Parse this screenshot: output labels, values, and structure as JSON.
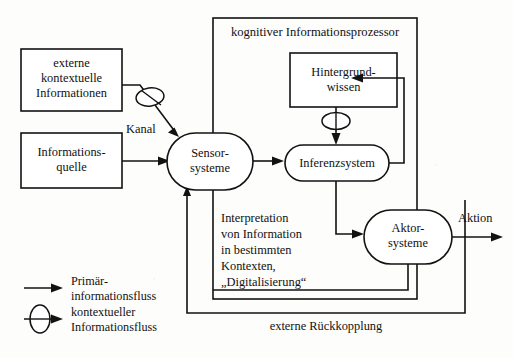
{
  "diagram": {
    "title_frame_label": "kognitiver Informationsprozessor",
    "nodes": {
      "externe_kontextuelle": {
        "lines": [
          "externe",
          "kontextuelle",
          "Informationen"
        ],
        "shape": "rect"
      },
      "informationsquelle": {
        "lines": [
          "Informations-",
          "quelle"
        ],
        "shape": "rect"
      },
      "sensorsysteme": {
        "lines": [
          "Sensor-",
          "systeme"
        ],
        "shape": "stadium"
      },
      "hintergrundwissen": {
        "lines": [
          "Hintergrund-",
          "wissen"
        ],
        "shape": "rect"
      },
      "inferenzsystem": {
        "lines": [
          "Inferenzsystem"
        ],
        "shape": "stadium"
      },
      "aktorsysteme": {
        "lines": [
          "Aktor-",
          "systeme"
        ],
        "shape": "stadium"
      }
    },
    "edge_labels": {
      "kanal": "Kanal",
      "aktion": "Aktion",
      "externe_rueckkopplung": "externe Rückkopplung"
    },
    "annotation": {
      "lines": [
        "Interpretation",
        "von Information",
        "in bestimmten",
        "Kontexten,",
        "„Digitalisierung“"
      ]
    },
    "legend": [
      {
        "symbol": "plain-arrow-icon",
        "lines": [
          "Primär-",
          "informationsfluss"
        ]
      },
      {
        "symbol": "ellipse-arrow-icon",
        "lines": [
          "kontextueller",
          "Informationsfluss"
        ]
      }
    ],
    "colors": {
      "stroke": "#121212",
      "background": "#fdfdfb",
      "node_fill": "#ffffff"
    }
  }
}
